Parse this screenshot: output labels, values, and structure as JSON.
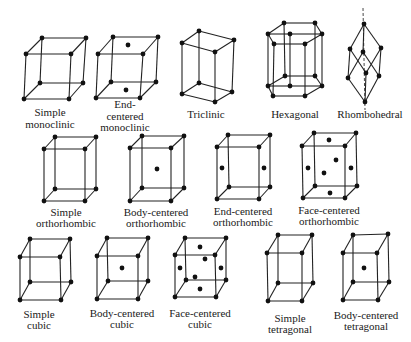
{
  "figure": {
    "lattices": [
      {
        "id": "simple-monoclinic",
        "label_lines": [
          "Simple",
          "monoclinic"
        ],
        "label_x": 50,
        "label_y": [
          112,
          124
        ],
        "vertices": [
          [
            42,
            38
          ],
          [
            86,
            38
          ],
          [
            71,
            54
          ],
          [
            26,
            54
          ],
          [
            40,
            83
          ],
          [
            83,
            83
          ],
          [
            69,
            99
          ],
          [
            24,
            99
          ]
        ],
        "edges": "box",
        "extra_atoms": []
      },
      {
        "id": "end-centered-monoclinic",
        "label_lines": [
          "End-",
          "centered",
          "monoclinic"
        ],
        "label_x": 125,
        "label_y": [
          104,
          116,
          127
        ],
        "vertices": [
          [
            113,
            37
          ],
          [
            158,
            37
          ],
          [
            143,
            54
          ],
          [
            98,
            54
          ],
          [
            111,
            82
          ],
          [
            156,
            82
          ],
          [
            140,
            98
          ],
          [
            96,
            98
          ]
        ],
        "edges": "box",
        "extra_atoms": [
          [
            128,
            45
          ],
          [
            126,
            90
          ]
        ]
      },
      {
        "id": "triclinic",
        "label_lines": [
          "Triclinic"
        ],
        "label_x": 206,
        "label_y": [
          114
        ],
        "vertices": [
          [
            199,
            31
          ],
          [
            234,
            40
          ],
          [
            215,
            52
          ],
          [
            182,
            43
          ],
          [
            199,
            83
          ],
          [
            232,
            92
          ],
          [
            215,
            102
          ],
          [
            182,
            94
          ]
        ],
        "edges": "box",
        "extra_atoms": []
      },
      {
        "id": "hexagonal",
        "label_lines": [
          "Hexagonal"
        ],
        "label_x": 295,
        "label_y": [
          114
        ],
        "top_hex": [
          [
            268,
            34
          ],
          [
            284,
            23
          ],
          [
            315,
            23
          ],
          [
            322,
            34
          ],
          [
            305,
            44
          ],
          [
            274,
            44
          ]
        ],
        "bottom_hex": [
          [
            268,
            86
          ],
          [
            285,
            76
          ],
          [
            315,
            76
          ],
          [
            322,
            86
          ],
          [
            305,
            96
          ],
          [
            273,
            96
          ]
        ],
        "edges": "hexprism",
        "extra_atoms": [
          [
            290,
            34
          ],
          [
            290,
            86
          ]
        ]
      },
      {
        "id": "rhombohedral",
        "label_lines": [
          "Rhombohedral"
        ],
        "label_x": 370,
        "label_y": [
          114
        ],
        "top": [
          364,
          24
        ],
        "upper": [
          [
            350,
            49
          ],
          [
            363,
            52
          ],
          [
            381,
            48
          ]
        ],
        "lower": [
          [
            348,
            78
          ],
          [
            366,
            73
          ],
          [
            379,
            76
          ]
        ],
        "bottom": [
          365,
          102
        ],
        "axis": [
          [
            363,
            8
          ],
          [
            365,
            110
          ]
        ],
        "edges": "rhombo",
        "extra_atoms": []
      },
      {
        "id": "simple-orthorhombic",
        "label_lines": [
          "Simple",
          "orthorhombic"
        ],
        "label_x": 66,
        "label_y": [
          212,
          223
        ],
        "vertices": [
          [
            55,
            137
          ],
          [
            96,
            137
          ],
          [
            85,
            149
          ],
          [
            44,
            149
          ],
          [
            55,
            189
          ],
          [
            96,
            189
          ],
          [
            85,
            201
          ],
          [
            44,
            201
          ]
        ],
        "edges": "box",
        "extra_atoms": []
      },
      {
        "id": "body-centered-orthorhombic",
        "label_lines": [
          "Body-centered",
          "orthorhombic"
        ],
        "label_x": 156,
        "label_y": [
          212,
          223
        ],
        "vertices": [
          [
            142,
            136
          ],
          [
            184,
            136
          ],
          [
            171,
            148
          ],
          [
            130,
            148
          ],
          [
            142,
            188
          ],
          [
            184,
            188
          ],
          [
            171,
            201
          ],
          [
            130,
            201
          ]
        ],
        "edges": "box",
        "extra_atoms": [
          [
            157,
            169
          ]
        ]
      },
      {
        "id": "end-centered-orthorhombic",
        "label_lines": [
          "End-centered",
          "orthorhombic"
        ],
        "label_x": 243,
        "label_y": [
          211,
          222
        ],
        "vertices": [
          [
            228,
            135
          ],
          [
            270,
            135
          ],
          [
            259,
            147
          ],
          [
            217,
            147
          ],
          [
            229,
            187
          ],
          [
            270,
            187
          ],
          [
            259,
            199
          ],
          [
            217,
            199
          ]
        ],
        "edges": "box",
        "extra_atoms": [
          [
            222,
            168
          ],
          [
            264,
            168
          ]
        ]
      },
      {
        "id": "face-centered-orthorhombic",
        "label_lines": [
          "Face-centered",
          "orthorhombic"
        ],
        "label_x": 329,
        "label_y": [
          210,
          221
        ],
        "vertices": [
          [
            314,
            133
          ],
          [
            356,
            133
          ],
          [
            345,
            146
          ],
          [
            302,
            146
          ],
          [
            315,
            186
          ],
          [
            357,
            186
          ],
          [
            345,
            198
          ],
          [
            303,
            198
          ]
        ],
        "edges": "box",
        "extra_atoms": [
          [
            329,
            140
          ],
          [
            336,
            160
          ],
          [
            308,
            168
          ],
          [
            324,
            173
          ],
          [
            351,
            168
          ],
          [
            330,
            193
          ]
        ]
      },
      {
        "id": "simple-cubic",
        "label_lines": [
          "Simple",
          "cubic"
        ],
        "label_x": 39,
        "label_y": [
          314,
          325
        ],
        "vertices": [
          [
            30,
            239
          ],
          [
            70,
            239
          ],
          [
            60,
            257
          ],
          [
            20,
            257
          ],
          [
            30,
            282
          ],
          [
            71,
            282
          ],
          [
            61,
            300
          ],
          [
            20,
            300
          ]
        ],
        "edges": "box",
        "extra_atoms": []
      },
      {
        "id": "body-centered-cubic",
        "label_lines": [
          "Body-centered",
          "cubic"
        ],
        "label_x": 122,
        "label_y": [
          313,
          324
        ],
        "vertices": [
          [
            107,
            238
          ],
          [
            148,
            238
          ],
          [
            138,
            256
          ],
          [
            97,
            256
          ],
          [
            108,
            281
          ],
          [
            148,
            281
          ],
          [
            138,
            299
          ],
          [
            97,
            299
          ]
        ],
        "edges": "box",
        "extra_atoms": [
          [
            122,
            268
          ]
        ]
      },
      {
        "id": "face-centered-cubic",
        "label_lines": [
          "Face-centered",
          "cubic"
        ],
        "label_x": 200,
        "label_y": [
          313,
          324
        ],
        "vertices": [
          [
            185,
            238
          ],
          [
            226,
            238
          ],
          [
            215,
            255
          ],
          [
            175,
            255
          ],
          [
            186,
            280
          ],
          [
            226,
            280
          ],
          [
            216,
            297
          ],
          [
            175,
            297
          ]
        ],
        "edges": "box",
        "extra_atoms": [
          [
            200,
            247
          ],
          [
            205,
            259
          ],
          [
            180,
            268
          ],
          [
            221,
            268
          ],
          [
            195,
            277
          ],
          [
            200,
            289
          ]
        ]
      },
      {
        "id": "simple-tetragonal",
        "label_lines": [
          "Simple",
          "tetragonal"
        ],
        "label_x": 290,
        "label_y": [
          318,
          329
        ],
        "vertices": [
          [
            278,
            235
          ],
          [
            312,
            235
          ],
          [
            302,
            253
          ],
          [
            267,
            253
          ],
          [
            278,
            283
          ],
          [
            313,
            283
          ],
          [
            302,
            301
          ],
          [
            268,
            301
          ]
        ],
        "edges": "box",
        "extra_atoms": []
      },
      {
        "id": "body-centered-tetragonal",
        "label_lines": [
          "Body-centered",
          "tetragonal"
        ],
        "label_x": 366,
        "label_y": [
          315,
          326
        ],
        "vertices": [
          [
            353,
            235
          ],
          [
            388,
            234
          ],
          [
            377,
            253
          ],
          [
            343,
            253
          ],
          [
            353,
            282
          ],
          [
            389,
            282
          ],
          [
            378,
            300
          ],
          [
            343,
            300
          ]
        ],
        "edges": "box",
        "extra_atoms": [
          [
            364,
            268
          ]
        ]
      }
    ]
  },
  "colors": {
    "line": "#222222",
    "atom": "#111111",
    "text": "#1a1a1a",
    "background": "#ffffff"
  }
}
